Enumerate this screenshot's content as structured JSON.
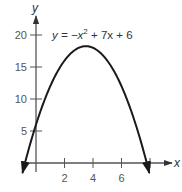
{
  "chart_data": {
    "type": "line",
    "title": "",
    "equation_label": "y = −x² + 7x + 6",
    "equation_parts": {
      "lhs": "y = −x",
      "exp": "2",
      "rhs": " + 7x + 6"
    },
    "xlabel": "x",
    "ylabel": "y",
    "xlim": [
      -1.0,
      8.5
    ],
    "ylim": [
      -3.0,
      23.0
    ],
    "x_ticks": [
      2,
      4,
      6,
      8
    ],
    "x_tick_labels": [
      "2",
      "4",
      "6",
      ""
    ],
    "y_ticks": [
      5,
      10,
      15,
      20
    ],
    "y_tick_labels": [
      "5",
      "10",
      "15",
      "20"
    ],
    "grid": false,
    "legend": "none",
    "series": [
      {
        "name": "y = -x^2 + 7x + 6",
        "function": {
          "a": -1,
          "b": 7,
          "c": 6
        },
        "x_range": [
          -0.95,
          7.95
        ],
        "x": [
          -0.95,
          -0.5,
          0,
          1,
          2,
          3,
          3.5,
          4,
          5,
          6,
          7,
          7.5,
          7.95
        ],
        "y": [
          -1.55,
          2.25,
          6,
          12,
          16,
          18,
          18.25,
          18,
          16,
          12,
          6,
          2.25,
          -1.55
        ],
        "arrows_both_ends": true,
        "color": "#1a1a1a"
      }
    ],
    "key_points": {
      "vertex": [
        3.5,
        18.25
      ],
      "y_intercept": [
        0,
        6
      ],
      "x_intercepts": [
        -0.77,
        7.77
      ]
    }
  },
  "layout": {
    "origin_px": [
      36,
      163
    ],
    "px_per_x": 14.25,
    "px_per_y": 6.4,
    "axis_color": "#555555",
    "curve_color": "#1a1a1a"
  }
}
